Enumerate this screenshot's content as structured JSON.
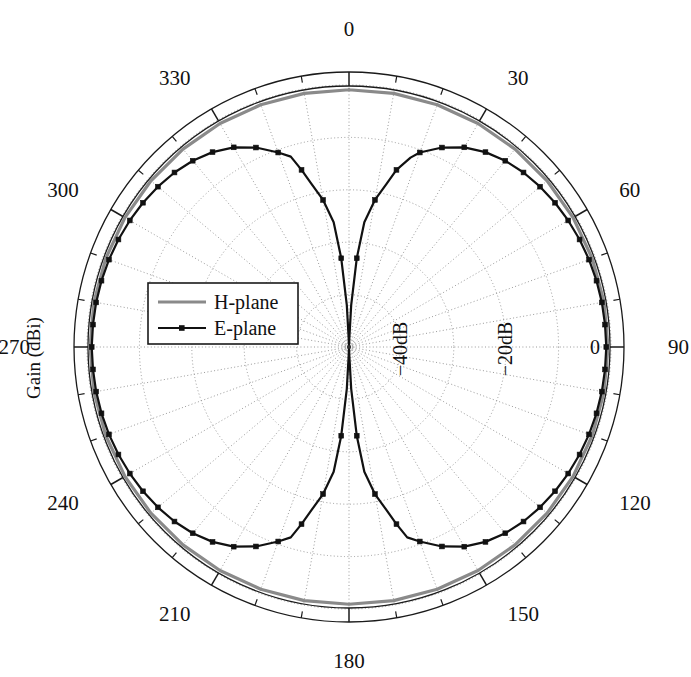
{
  "figure": {
    "type": "polar-radiation-pattern",
    "axis_title": "Gain (dBi)",
    "background_color": "#ffffff"
  },
  "legend": {
    "position": "left-center-inside",
    "entries": [
      {
        "label": "H-plane",
        "color": "#8a8a8a",
        "marker": "none",
        "line_width": 3.0
      },
      {
        "label": "E-plane",
        "color": "#111111",
        "marker": "square",
        "line_width": 2.2
      }
    ]
  },
  "chart_data": {
    "type": "line",
    "subtype": "polar",
    "title": "",
    "xlabel": "",
    "ylabel": "Gain (dBi)",
    "angle_unit": "degrees",
    "angle_zero_at": "top",
    "angle_direction": "clockwise",
    "angle_ticks": [
      0,
      30,
      60,
      90,
      120,
      150,
      180,
      210,
      240,
      270,
      300,
      330
    ],
    "angle_tick_labels": [
      "0",
      "30",
      "60",
      "90",
      "120",
      "150",
      "180",
      "210",
      "240",
      "270",
      "300",
      "330"
    ],
    "angle_minor_tick_step": 10,
    "radial_ticks": [
      -40,
      -20,
      0
    ],
    "radial_tick_labels": [
      "−40dB",
      "−20dB",
      "0"
    ],
    "radial_gridline_values": [
      -50,
      -40,
      -30,
      -20,
      -10,
      0
    ],
    "rlim": [
      -50,
      0
    ],
    "grid": true,
    "grid_style": "dotted",
    "legend_position": "left-center",
    "series": [
      {
        "name": "H-plane",
        "color": "#8a8a8a",
        "marker": "none",
        "angles": [
          0,
          10,
          20,
          30,
          40,
          50,
          60,
          70,
          80,
          90,
          100,
          110,
          120,
          130,
          140,
          150,
          160,
          170,
          180,
          190,
          200,
          210,
          220,
          230,
          240,
          250,
          260,
          270,
          280,
          290,
          300,
          310,
          320,
          330,
          340,
          350,
          360
        ],
        "values": [
          -0.9,
          -0.85,
          -0.8,
          -0.75,
          -0.7,
          -0.65,
          -0.62,
          -0.6,
          -0.58,
          -0.57,
          -0.58,
          -0.6,
          -0.62,
          -0.65,
          -0.7,
          -0.75,
          -0.8,
          -0.85,
          -0.9,
          -0.85,
          -0.8,
          -0.75,
          -0.7,
          -0.65,
          -0.62,
          -0.6,
          -0.58,
          -0.57,
          -0.58,
          -0.6,
          -0.62,
          -0.65,
          -0.7,
          -0.75,
          -0.8,
          -0.85,
          -0.9
        ]
      },
      {
        "name": "E-plane",
        "color": "#111111",
        "marker": "square",
        "angles": [
          0,
          3,
          5,
          7,
          10,
          13,
          15,
          18,
          20,
          25,
          30,
          35,
          40,
          45,
          50,
          55,
          60,
          65,
          70,
          75,
          80,
          85,
          90,
          95,
          100,
          105,
          110,
          115,
          120,
          125,
          130,
          135,
          140,
          145,
          150,
          155,
          160,
          163,
          165,
          167,
          170,
          173,
          175,
          177,
          180,
          183,
          185,
          187,
          190,
          193,
          195,
          197,
          200,
          205,
          210,
          215,
          220,
          225,
          230,
          235,
          240,
          245,
          250,
          255,
          260,
          265,
          270,
          275,
          280,
          285,
          290,
          295,
          300,
          305,
          310,
          315,
          320,
          325,
          330,
          335,
          340,
          343,
          345,
          347,
          350,
          353,
          355,
          357,
          360
        ],
        "values": [
          -49.5,
          -42.0,
          -33.0,
          -26.0,
          -21.5,
          -18.0,
          -15.0,
          -12.0,
          -10.5,
          -8.0,
          -6.0,
          -4.6,
          -3.6,
          -2.9,
          -2.4,
          -2.0,
          -1.7,
          -1.45,
          -1.25,
          -1.1,
          -1.0,
          -0.95,
          -0.9,
          -0.95,
          -1.0,
          -1.1,
          -1.25,
          -1.45,
          -1.7,
          -2.0,
          -2.4,
          -2.9,
          -3.6,
          -4.6,
          -6.0,
          -8.0,
          -10.5,
          -12.0,
          -15.0,
          -18.0,
          -21.5,
          -26.0,
          -33.0,
          -42.0,
          -49.5,
          -42.0,
          -33.0,
          -26.0,
          -21.5,
          -18.0,
          -15.0,
          -12.0,
          -10.5,
          -8.0,
          -6.0,
          -4.6,
          -3.6,
          -2.9,
          -2.4,
          -2.0,
          -1.7,
          -1.45,
          -1.25,
          -1.1,
          -1.0,
          -0.95,
          -0.9,
          -0.95,
          -1.0,
          -1.1,
          -1.25,
          -1.45,
          -1.7,
          -2.0,
          -2.4,
          -2.9,
          -3.6,
          -4.6,
          -6.0,
          -8.0,
          -10.5,
          -12.0,
          -15.0,
          -18.0,
          -21.5,
          -26.0,
          -33.0,
          -42.0,
          -49.5
        ]
      }
    ]
  }
}
